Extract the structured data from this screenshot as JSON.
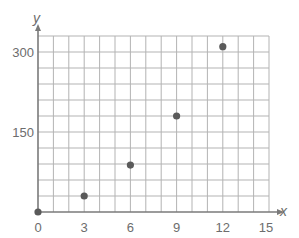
{
  "chart_data": {
    "type": "scatter",
    "title": "",
    "xlabel": "x",
    "ylabel": "y",
    "xlim": [
      0,
      15
    ],
    "ylim": [
      0,
      330
    ],
    "x_grid_step": 1,
    "y_grid_step": 30,
    "grid": true,
    "x_ticks": [
      0,
      3,
      6,
      9,
      12,
      15
    ],
    "x_tick_labels": [
      "0",
      "3",
      "6",
      "9",
      "12",
      "15"
    ],
    "y_ticks": [
      150,
      300
    ],
    "y_tick_labels": [
      "150",
      "300"
    ],
    "points": [
      {
        "x": 0,
        "y": 0
      },
      {
        "x": 3,
        "y": 30
      },
      {
        "x": 6,
        "y": 88
      },
      {
        "x": 9,
        "y": 180
      },
      {
        "x": 12,
        "y": 310
      }
    ],
    "colors": {
      "grid": "#b3b3b3",
      "axis": "#7a7a7a",
      "point": "#5a5a5a",
      "text": "#6d6d6d"
    }
  }
}
